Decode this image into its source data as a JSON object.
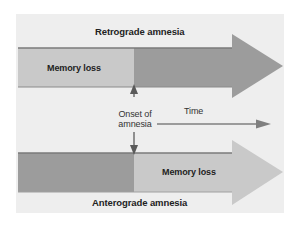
{
  "diagram": {
    "colors": {
      "panel": "#eeeeee",
      "bar_light": "#c9c9c9",
      "bar_dark": "#9c9c9c",
      "bar_edge": "#7a7a7a",
      "arrow_line": "#7f7f7f",
      "text": "#222222"
    },
    "retrograde": {
      "title": "Retrograde amnesia",
      "segment_label": "Memory loss",
      "memory_loss_side": "before-onset"
    },
    "anterograde": {
      "title": "Anterograde amnesia",
      "segment_label": "Memory loss",
      "memory_loss_side": "after-onset"
    },
    "onset": {
      "line1": "Onset of",
      "line2": "amnesia"
    },
    "time_axis": {
      "label": "Time",
      "direction": "right"
    }
  }
}
